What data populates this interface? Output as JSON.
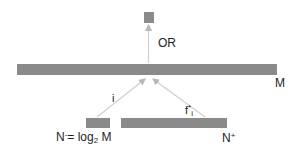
{
  "diagram": {
    "nodes": {
      "output": {
        "label": "",
        "color": "#8a8a8a"
      },
      "main_bar": {
        "label": "M",
        "color": "#8a8a8a"
      },
      "index_bar": {
        "label_prefix": "N",
        "label_sup": "-",
        "label_mid": "= log",
        "label_sub": "2",
        "label_suffix": " M",
        "color": "#8a8a8a"
      },
      "feature_bar": {
        "label_prefix": "N",
        "label_sup": "+",
        "color": "#8a8a8a"
      }
    },
    "edges": {
      "or_edge": {
        "label": "OR"
      },
      "index_edge": {
        "label": "i"
      },
      "feature_edge": {
        "label_prefix": "f",
        "label_sup": "*",
        "label_sub": "i"
      }
    },
    "colors": {
      "block": "#8a8a8a",
      "arrow": "#c8c8c8",
      "text": "#1e1e1e"
    }
  }
}
